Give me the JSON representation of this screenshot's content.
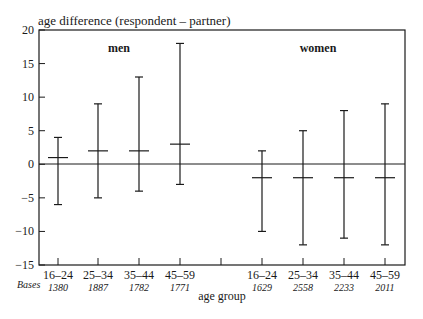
{
  "chart_data": {
    "type": "errorbar",
    "title": "",
    "ylabel": "age difference (respondent – partner)",
    "xlabel": "age group",
    "ylim": [
      -15,
      20
    ],
    "yticks": [
      20,
      15,
      10,
      5,
      0,
      -5,
      -10,
      -15
    ],
    "ytick_labels": [
      "20",
      "15",
      "10",
      "5",
      "0",
      "−5",
      "−10",
      "−15"
    ],
    "bases_label": "Bases",
    "grid": false,
    "reference_line": 0,
    "groups": [
      {
        "name": "men",
        "categories": [
          "16–24",
          "25–34",
          "35–44",
          "45–59"
        ],
        "bases": [
          "1380",
          "1887",
          "1782",
          "1771"
        ],
        "mean": [
          1,
          2,
          2,
          3
        ],
        "upper": [
          4,
          9,
          13,
          18
        ],
        "lower": [
          -6,
          -5,
          -4,
          -3
        ]
      },
      {
        "name": "women",
        "categories": [
          "16–24",
          "25–34",
          "35–44",
          "45–59"
        ],
        "bases": [
          "1629",
          "2558",
          "2233",
          "2011"
        ],
        "mean": [
          -2,
          -2,
          -2,
          -2
        ],
        "upper": [
          2,
          5,
          8,
          9
        ],
        "lower": [
          -10,
          -12,
          -11,
          -12
        ]
      }
    ]
  }
}
